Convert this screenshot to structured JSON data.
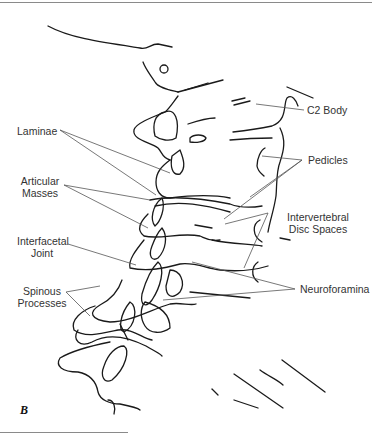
{
  "figure": {
    "panel_label": "B",
    "labels": {
      "c2_body": "C2 Body",
      "laminae": "Laminae",
      "pedicles": "Pedicles",
      "articular_masses_1": "Articular",
      "articular_masses_2": "Masses",
      "intervertebral_1": "Intervertebral",
      "intervertebral_2": "Disc Spaces",
      "interfacetal_1": "Interfacetal",
      "interfacetal_2": "Joint",
      "neuroforamina": "Neuroforamina",
      "spinous_1": "Spinous",
      "spinous_2": "Processes"
    }
  }
}
